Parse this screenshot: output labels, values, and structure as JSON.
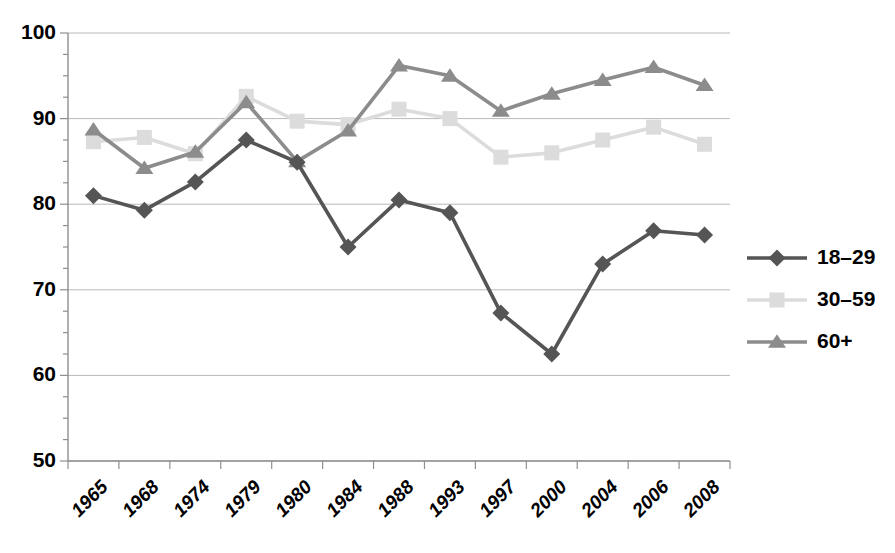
{
  "chart_data": {
    "type": "line",
    "title": "",
    "subtitle": "",
    "xlabel": "",
    "ylabel": "",
    "grid": true,
    "legend_position": "right",
    "ylim": [
      50,
      100
    ],
    "yticks": [
      100,
      90,
      80,
      70,
      60,
      50
    ],
    "categories": [
      "1965",
      "1968",
      "1974",
      "1979",
      "1980",
      "1984",
      "1988",
      "1993",
      "1997",
      "2000",
      "2004",
      "2006",
      "2008"
    ],
    "series": [
      {
        "name": "18–29",
        "marker": "diamond",
        "color": "#555555",
        "values": [
          81.0,
          79.3,
          82.6,
          87.5,
          84.9,
          75.0,
          80.5,
          79.0,
          67.3,
          62.5,
          73.0,
          76.9,
          76.4
        ]
      },
      {
        "name": "30–59",
        "marker": "square",
        "color": "#dcdcdc",
        "values": [
          87.3,
          87.8,
          85.9,
          92.6,
          89.7,
          89.3,
          91.1,
          90.0,
          85.5,
          86.0,
          87.5,
          89.0,
          87.0
        ]
      },
      {
        "name": "60+",
        "marker": "triangle",
        "color": "#8c8c8c",
        "values": [
          88.7,
          84.2,
          86.1,
          91.9,
          85.0,
          88.6,
          96.2,
          95.0,
          90.9,
          92.9,
          94.5,
          96.0,
          93.9
        ]
      }
    ]
  },
  "axes": {
    "y_tick_labels": [
      "100",
      "90",
      "80",
      "70",
      "60",
      "50"
    ],
    "x_tick_labels": [
      "1965",
      "1968",
      "1974",
      "1979",
      "1980",
      "1984",
      "1988",
      "1993",
      "1997",
      "2000",
      "2004",
      "2006",
      "2008"
    ]
  },
  "legend": {
    "entries": [
      {
        "label": "18–29",
        "color": "#555555",
        "marker": "diamond"
      },
      {
        "label": "30–59",
        "color": "#dcdcdc",
        "marker": "square"
      },
      {
        "label": "60+",
        "color": "#8c8c8c",
        "marker": "triangle"
      }
    ]
  },
  "colors": {
    "grid": "#b9b9b9",
    "axis": "#8f8f8f",
    "background": "#ffffff",
    "series_18_29": "#555555",
    "series_30_59": "#dcdcdc",
    "series_60_plus": "#8c8c8c"
  }
}
